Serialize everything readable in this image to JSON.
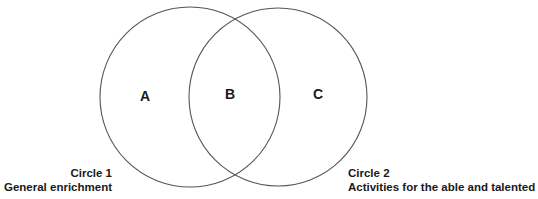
{
  "diagram": {
    "type": "venn",
    "circles": [
      {
        "id": "circle-1",
        "cx": 190,
        "cy": 97,
        "r": 90,
        "stroke": "#555555"
      },
      {
        "id": "circle-2",
        "cx": 278,
        "cy": 97,
        "r": 89,
        "stroke": "#555555"
      }
    ],
    "regions": {
      "a": "A",
      "b": "B",
      "c": "C"
    },
    "captions": {
      "circle1": {
        "title": "Circle 1",
        "subtitle": "General enrichment"
      },
      "circle2": {
        "title": "Circle 2",
        "subtitle": "Activities for the able and talented"
      }
    }
  }
}
